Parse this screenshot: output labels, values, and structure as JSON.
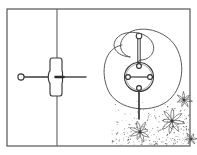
{
  "illustration": {
    "title": "Line-art technical illustration",
    "caption": "Framed panel with vertical divider; anchor pin fitting at left; spiral loop assembly with circular hub and vertical rod at right; stippled flowers in lower right corner",
    "style": "black-and-white pen-and-ink line drawing",
    "canvas": {
      "width": 197,
      "height": 155
    },
    "colors": {
      "background": "#ffffff",
      "ink": "#2b2b2b",
      "ink_light": "#6f6f6f",
      "ink_faint": "#9a9a9a",
      "frame": "#555555"
    },
    "frame": {
      "name": "outer-frame",
      "x": 7,
      "y": 9,
      "width": 183,
      "height": 137,
      "stroke_width": 1.2
    },
    "divider": {
      "name": "vertical-divider",
      "x": 57,
      "y1": 9,
      "y2": 146,
      "stroke_width": 1.1
    },
    "left_assembly": {
      "name": "anchor-pin-assembly",
      "knob": {
        "cx": 21,
        "cy": 77,
        "r": 3.1
      },
      "shaft": {
        "x1": 24,
        "y1": 77,
        "x2": 50,
        "y2": 77
      },
      "cross_fitting": {
        "cx": 57,
        "cy": 77,
        "half_width": 7.5,
        "half_height": 19,
        "waist": 5
      },
      "output_rod": {
        "x1": 62,
        "y1": 77,
        "x2": 86,
        "y2": 77
      }
    },
    "right_assembly": {
      "name": "spiral-hub-assembly",
      "outer_loop_label": "large outer spiral loop",
      "inner_loop_label": "inner spiral return",
      "hub": {
        "cx": 139,
        "cy": 77,
        "r": 14.5
      },
      "hub_inner": {
        "cx": 139,
        "cy": 77,
        "r": 13.0
      },
      "spokes": [
        {
          "name": "spoke-left",
          "cx": 128,
          "cy": 77,
          "r": 2.4
        },
        {
          "name": "spoke-right",
          "cx": 150,
          "cy": 77,
          "r": 2.4
        },
        {
          "name": "spoke-top",
          "cx": 139,
          "cy": 66,
          "r": 2.4
        },
        {
          "name": "spoke-bottom",
          "cx": 139,
          "cy": 88,
          "r": 2.4
        }
      ],
      "vertical_rod": {
        "x": 139,
        "y_top": 36,
        "y_bottom": 119,
        "width": 2.4
      },
      "rod_cap": {
        "cx": 139,
        "cy": 36,
        "r": 2.8
      }
    },
    "flora": {
      "name": "stippled-flowers",
      "count": 4,
      "flowers": [
        {
          "cx": 140,
          "cy": 132,
          "r": 11,
          "petals": 8
        },
        {
          "cx": 172,
          "cy": 121,
          "r": 12,
          "petals": 8
        },
        {
          "cx": 184,
          "cy": 100,
          "r": 8,
          "petals": 7
        },
        {
          "cx": 191,
          "cy": 139,
          "r": 7,
          "petals": 6
        }
      ],
      "speckle_region": {
        "x": 112,
        "y": 92,
        "width": 78,
        "height": 54
      }
    }
  }
}
